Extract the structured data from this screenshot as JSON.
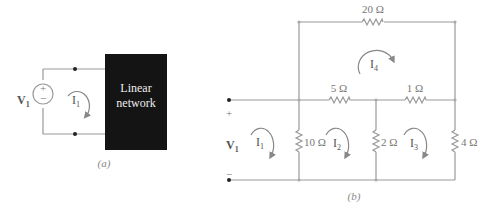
{
  "figure_a": {
    "caption": "(a)",
    "source_label": "V",
    "source_sub": "1",
    "plus": "+",
    "minus": "−",
    "current_label": "I",
    "current_sub": "1",
    "network_line1": "Linear",
    "network_line2": "network",
    "network_color": "#141414"
  },
  "figure_b": {
    "caption": "(b)",
    "source_label": "V",
    "source_sub": "1",
    "plus": "+",
    "minus": "−",
    "resistors": {
      "r20": "20 Ω",
      "r5": "5 Ω",
      "r1": "1 Ω",
      "r10": "10 Ω",
      "r2": "2 Ω",
      "r4": "4 Ω"
    },
    "currents": {
      "i1": {
        "label": "I",
        "sub": "1"
      },
      "i2": {
        "label": "I",
        "sub": "2"
      },
      "i3": {
        "label": "I",
        "sub": "3"
      },
      "i4": {
        "label": "I",
        "sub": "4"
      }
    }
  }
}
